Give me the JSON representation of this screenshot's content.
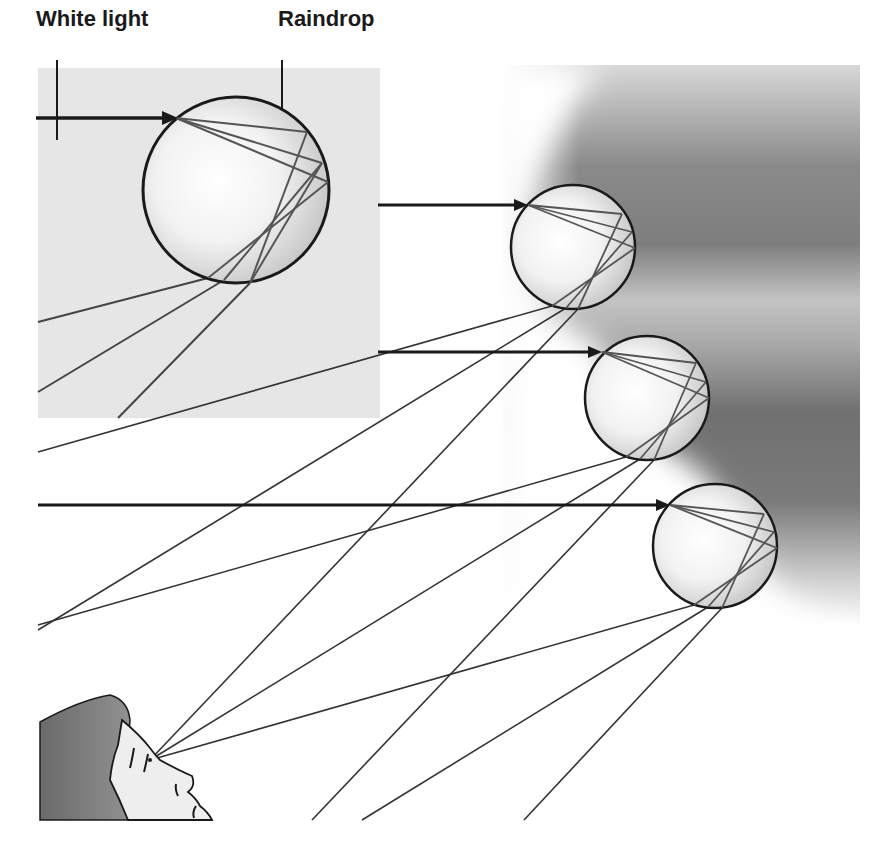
{
  "diagram": {
    "labels": {
      "white_light": "White light",
      "raindrop": "Raindrop"
    },
    "colors": {
      "inset_background": "#e6e6e6",
      "sky_dark": "#7a7a7a",
      "ray_dark": "#222222",
      "ray_gray": "#555555",
      "drop_outline": "#1a1a1a",
      "hair": "#777777",
      "skin": "#eeeeee"
    },
    "inset": {
      "x": 38,
      "y": 68,
      "width": 342,
      "height": 350
    },
    "drops": [
      {
        "name": "inset-drop",
        "cx": 236,
        "cy": 190,
        "r": 93,
        "entry_arrow_y": 118,
        "arrow_start_x": 36
      },
      {
        "name": "drop-1",
        "cx": 573,
        "cy": 247,
        "r": 62,
        "entry_arrow_y": 205,
        "arrow_start_x": 378
      },
      {
        "name": "drop-2",
        "cx": 647,
        "cy": 398,
        "r": 62,
        "entry_arrow_y": 352,
        "arrow_start_x": 378
      },
      {
        "name": "drop-3",
        "cx": 715,
        "cy": 546,
        "r": 62,
        "entry_arrow_y": 505,
        "arrow_start_x": 38
      }
    ],
    "observer": {
      "eye_x": 150,
      "eye_y": 760
    }
  }
}
